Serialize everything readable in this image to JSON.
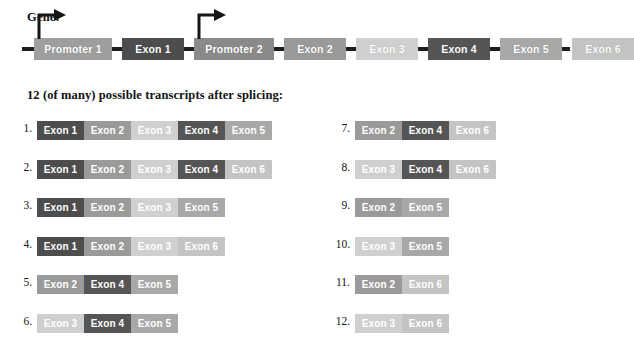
{
  "gene": {
    "label": "Gene:",
    "elements": [
      {
        "name": "promoter-1",
        "label": "Promoter 1",
        "type": "promoter",
        "color": "#9e9e9e",
        "x": 34,
        "width": 78,
        "arrow": true
      },
      {
        "name": "exon-1",
        "label": "Exon 1",
        "type": "exon",
        "color": "#4d4d4d",
        "x": 122,
        "width": 62,
        "arrow": false
      },
      {
        "name": "promoter-2",
        "label": "Promoter 2",
        "type": "promoter",
        "color": "#8a8a8a",
        "x": 194,
        "width": 80,
        "arrow": true
      },
      {
        "name": "exon-2",
        "label": "Exon 2",
        "type": "exon",
        "color": "#9a9a9a",
        "x": 284,
        "width": 62,
        "arrow": false
      },
      {
        "name": "exon-3",
        "label": "Exon 3",
        "type": "exon",
        "color": "#cfcfcf",
        "x": 356,
        "width": 62,
        "arrow": false
      },
      {
        "name": "exon-4",
        "label": "Exon 4",
        "type": "exon",
        "color": "#555555",
        "x": 428,
        "width": 62,
        "arrow": false
      },
      {
        "name": "exon-5",
        "label": "Exon 5",
        "type": "exon",
        "color": "#a8a8a8",
        "x": 500,
        "width": 62,
        "arrow": false
      },
      {
        "name": "exon-6",
        "label": "Exon 6",
        "type": "exon",
        "color": "#c4c4c4",
        "x": 572,
        "width": 62,
        "arrow": false
      }
    ]
  },
  "transcripts_caption": "12 (of many) possible transcripts after splicing:",
  "exon_colors": {
    "Exon 1": "#4d4d4d",
    "Exon 2": "#9a9a9a",
    "Exon 3": "#cfcfcf",
    "Exon 4": "#555555",
    "Exon 5": "#a8a8a8",
    "Exon 6": "#c4c4c4"
  },
  "transcripts": [
    {
      "number": "1.",
      "column": "left",
      "row": 0,
      "exons": [
        "Exon 1",
        "Exon 2",
        "Exon 3",
        "Exon 4",
        "Exon 5"
      ]
    },
    {
      "number": "2.",
      "column": "left",
      "row": 1,
      "exons": [
        "Exon 1",
        "Exon 2",
        "Exon 3",
        "Exon 4",
        "Exon 6"
      ]
    },
    {
      "number": "3.",
      "column": "left",
      "row": 2,
      "exons": [
        "Exon 1",
        "Exon 2",
        "Exon 3",
        "Exon 5"
      ]
    },
    {
      "number": "4.",
      "column": "left",
      "row": 3,
      "exons": [
        "Exon 1",
        "Exon 2",
        "Exon 3",
        "Exon 6"
      ]
    },
    {
      "number": "5.",
      "column": "left",
      "row": 4,
      "exons": [
        "Exon 2",
        "Exon 4",
        "Exon 5"
      ]
    },
    {
      "number": "6.",
      "column": "left",
      "row": 5,
      "exons": [
        "Exon 3",
        "Exon 4",
        "Exon 5"
      ]
    },
    {
      "number": "7.",
      "column": "right",
      "row": 0,
      "exons": [
        "Exon 2",
        "Exon 4",
        "Exon 6"
      ]
    },
    {
      "number": "8.",
      "column": "right",
      "row": 1,
      "exons": [
        "Exon 3",
        "Exon 4",
        "Exon 6"
      ]
    },
    {
      "number": "9.",
      "column": "right",
      "row": 2,
      "exons": [
        "Exon 2",
        "Exon 5"
      ]
    },
    {
      "number": "10.",
      "column": "right",
      "row": 3,
      "exons": [
        "Exon 3",
        "Exon 5"
      ]
    },
    {
      "number": "11.",
      "column": "right",
      "row": 4,
      "exons": [
        "Exon 2",
        "Exon 6"
      ]
    },
    {
      "number": "12.",
      "column": "right",
      "row": 5,
      "exons": [
        "Exon 3",
        "Exon 6"
      ]
    }
  ],
  "layout": {
    "left_column_x": 37,
    "right_column_x": 355,
    "first_row_y": 121,
    "row_spacing": 38.6,
    "segment_width": 47
  }
}
